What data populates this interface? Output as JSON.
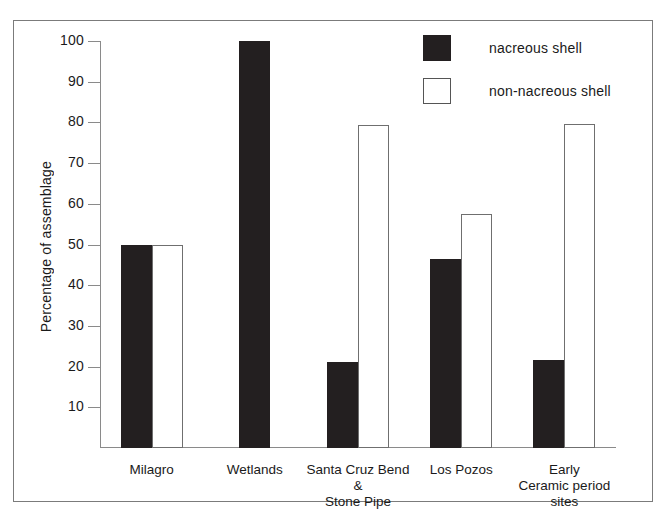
{
  "chart_data": {
    "type": "bar",
    "title": "",
    "xlabel": "",
    "ylabel": "Percentage of assemblage",
    "ylim": [
      0,
      100
    ],
    "ytick_step": 10,
    "yticks": [
      100,
      90,
      80,
      70,
      60,
      50,
      40,
      30,
      20,
      10
    ],
    "grid": false,
    "legend_position": "top-right",
    "categories": [
      "Milagro",
      "Wetlands",
      "Santa Cruz Bend\n&\nStone Pipe",
      "Los Pozos",
      "Early\nCeramic period\nsites"
    ],
    "series": [
      {
        "name": "nacreous shell",
        "style": "solid",
        "color": "#231f20",
        "values": [
          50,
          100,
          21.1,
          46.5,
          21.7
        ]
      },
      {
        "name": "non-nacreous shell",
        "style": "hollow",
        "color": "#ffffff",
        "border_color": "#6f6f6f",
        "values": [
          50,
          0,
          79.3,
          57.6,
          79.7
        ]
      }
    ]
  },
  "legend": {
    "items": [
      {
        "label": "nacreous shell",
        "style": "solid"
      },
      {
        "label": "non-nacreous shell",
        "style": "hollow"
      }
    ]
  },
  "axis": {
    "y_title": "Percentage of assemblage"
  }
}
